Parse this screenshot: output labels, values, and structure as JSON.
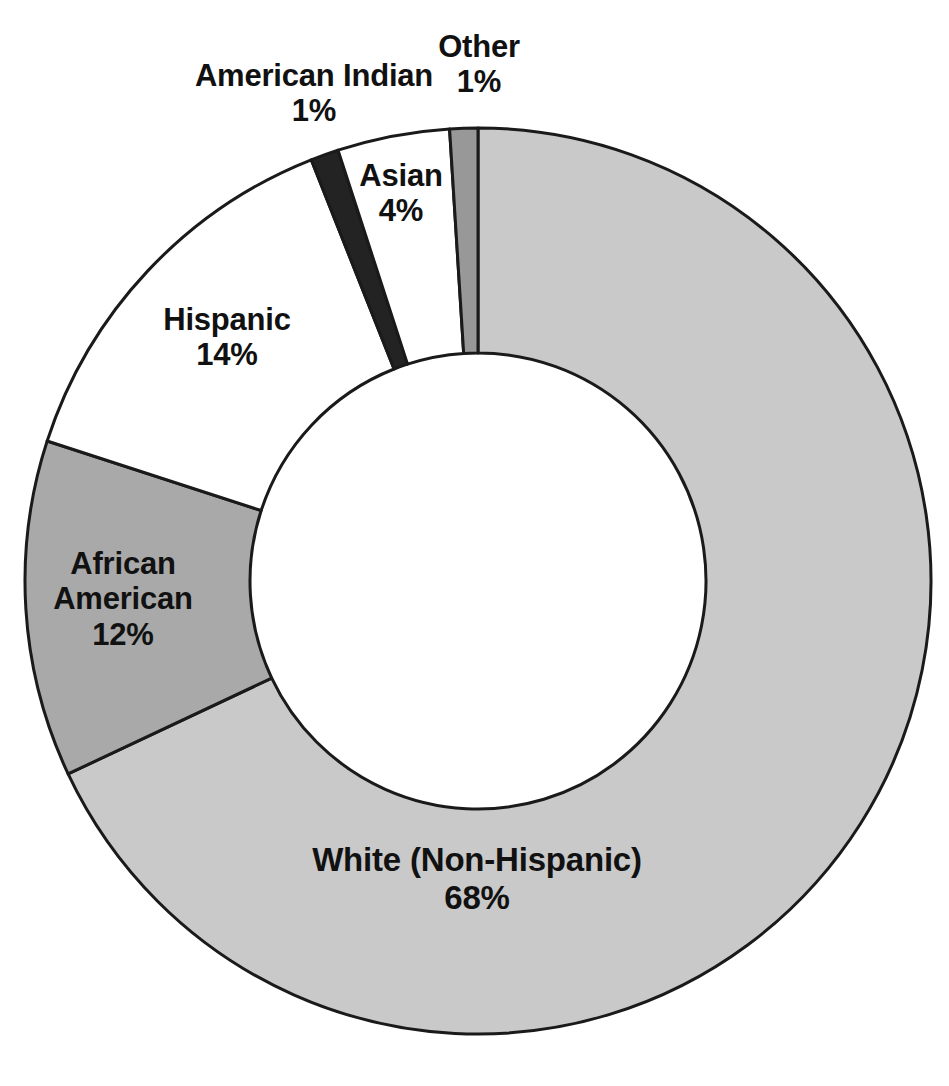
{
  "chart_data": {
    "type": "pie",
    "variant": "donut",
    "title": "",
    "subtitle": "",
    "xlabel": "",
    "ylabel": "",
    "legend": "none",
    "grid": false,
    "units": "percent",
    "total": 100,
    "start_angle_deg": 0,
    "direction": "clockwise",
    "categories": [
      "White (Non-Hispanic)",
      "African American",
      "Hispanic",
      "American Indian",
      "Asian",
      "Other"
    ],
    "values": [
      68,
      12,
      14,
      1,
      4,
      1
    ],
    "value_labels": [
      "68%",
      "12%",
      "14%",
      "1%",
      "4%",
      "1%"
    ],
    "slices": [
      {
        "name": "White (Non-Hispanic)",
        "value": 68,
        "value_label": "68%",
        "color": "#c9c9c9",
        "label_lines": [
          "White (Non-Hispanic)",
          "68%"
        ]
      },
      {
        "name": "African American",
        "value": 12,
        "value_label": "12%",
        "color": "#a9a9a9",
        "label_lines": [
          "African",
          "American",
          "12%"
        ]
      },
      {
        "name": "Hispanic",
        "value": 14,
        "value_label": "14%",
        "color": "#ffffff",
        "label_lines": [
          "Hispanic",
          "14%"
        ]
      },
      {
        "name": "American Indian",
        "value": 1,
        "value_label": "1%",
        "color": "#232323",
        "label_lines": [
          "American Indian",
          "1%"
        ]
      },
      {
        "name": "Asian",
        "value": 4,
        "value_label": "4%",
        "color": "#ffffff",
        "label_lines": [
          "Asian",
          "4%"
        ]
      },
      {
        "name": "Other",
        "value": 1,
        "value_label": "1%",
        "color": "#989898",
        "label_lines": [
          "Other",
          "1%"
        ]
      }
    ],
    "style": {
      "stroke_color": "#1a1a1a",
      "stroke_width": 3,
      "background": "#ffffff",
      "center_x": 478,
      "center_y": 581,
      "outer_radius": 453,
      "inner_radius": 228
    }
  },
  "labels": {
    "white": {
      "name": "White (Non-Hispanic)",
      "value": "68%"
    },
    "african_american": {
      "line1": "African",
      "line2": "American",
      "value": "12%"
    },
    "hispanic": {
      "name": "Hispanic",
      "value": "14%"
    },
    "american_indian": {
      "name": "American Indian",
      "value": "1%"
    },
    "asian": {
      "name": "Asian",
      "value": "4%"
    },
    "other": {
      "name": "Other",
      "value": "1%"
    }
  }
}
